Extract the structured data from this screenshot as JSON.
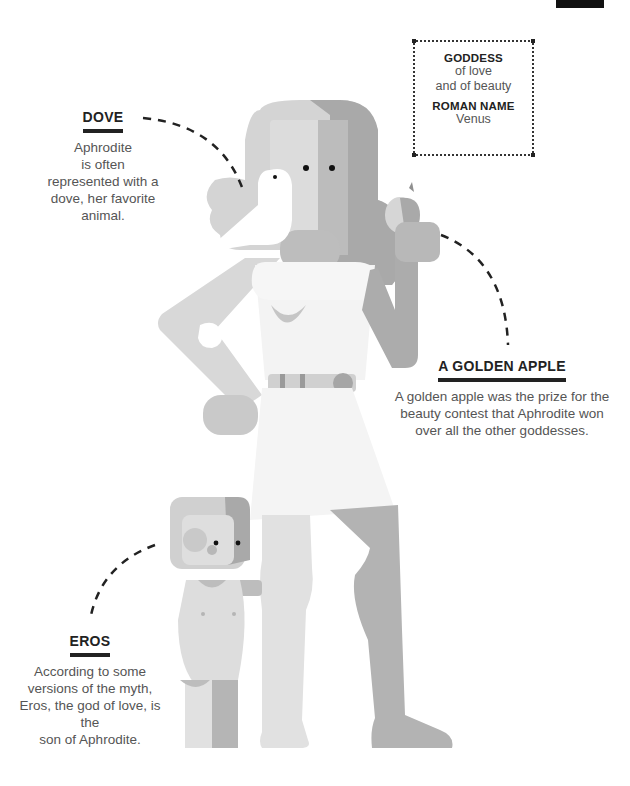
{
  "info_box": {
    "heading1": "GODDESS",
    "line1": "of love",
    "line2": "and of beauty",
    "heading2": "ROMAN NAME",
    "line3": "Venus"
  },
  "dove": {
    "title": "DOVE",
    "lines": [
      "Aphrodite",
      "is often",
      "represented with a",
      "dove, her favorite",
      "animal."
    ]
  },
  "apple": {
    "title": "A GOLDEN APPLE",
    "lines": [
      "A golden apple was the prize for the",
      "beauty contest that Aphrodite won",
      "over all the other goddesses."
    ]
  },
  "eros": {
    "title": "EROS",
    "lines": [
      "According to some",
      "versions of the myth,",
      "Eros, the god of love, is the",
      "son of Aphrodite."
    ]
  },
  "colors": {
    "ink": "#222222",
    "text": "#555555",
    "light_gray": "#d9d9d9",
    "mid_gray": "#bdbdbd",
    "dark_gray": "#a6a6a6"
  }
}
